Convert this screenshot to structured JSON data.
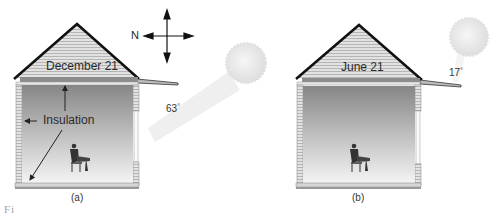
{
  "panels": [
    {
      "id": "a",
      "date_label": "December 21",
      "sun_angle": "63",
      "degree_symbol": "°",
      "caption": "(a)",
      "insulation_label": "Insulation"
    },
    {
      "id": "b",
      "date_label": "June 21",
      "sun_angle": "17",
      "degree_symbol": "°",
      "caption": "(b)"
    }
  ],
  "compass": {
    "north_label": "N"
  },
  "figure_caption_fragment": "Fi",
  "colors": {
    "roof_outline": "#111111",
    "siding": "#d8d8d8",
    "interior_top": "#8a8a8a",
    "interior_bottom": "#f2f2f2",
    "sun": "#e6e6e6",
    "beam": "#efefef"
  }
}
